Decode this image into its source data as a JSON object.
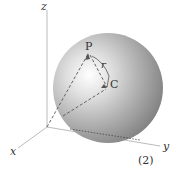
{
  "diagram": {
    "axes": {
      "x": "x",
      "y": "y",
      "z": "z"
    },
    "points": {
      "P": "P",
      "C": "C"
    },
    "radius_label": "r",
    "figure_number": "(2)",
    "colors": {
      "sphere_light": "#ffffff",
      "sphere_mid": "#b4b4b4",
      "sphere_dark": "#707070",
      "axis": "#aaaaaa",
      "dashed": "#555555"
    }
  }
}
